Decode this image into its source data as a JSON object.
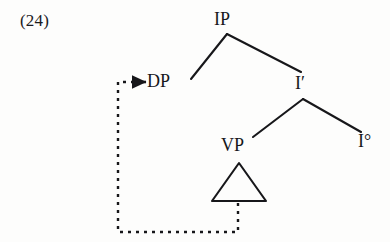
{
  "figure": {
    "example_number": "(24)",
    "background_color": "#fdfdfc",
    "ink_color": "#17171a",
    "caption_note": "syntax tree with DP movement from VP-internal position to specifier of IP"
  },
  "tree": {
    "nodes": [
      {
        "id": "ip",
        "label": "IP",
        "x": 227,
        "y": 20,
        "role": "root"
      },
      {
        "id": "dp",
        "label": "DP",
        "x": 167,
        "y": 84,
        "role": "specifier"
      },
      {
        "id": "ibar",
        "label": "I′",
        "x": 303,
        "y": 85,
        "role": "intermediate"
      },
      {
        "id": "vp",
        "label": "VP",
        "x": 236,
        "y": 148,
        "role": "complement"
      },
      {
        "id": "i0",
        "label": "I°",
        "x": 368,
        "y": 143,
        "role": "head"
      }
    ],
    "branches": [
      {
        "from": "ip",
        "to": "dp",
        "x1": 227,
        "y1": 34,
        "x2": 191,
        "y2": 79
      },
      {
        "from": "ip",
        "to": "ibar",
        "x1": 227,
        "y1": 34,
        "x2": 301,
        "y2": 72
      },
      {
        "from": "ibar",
        "to": "vp",
        "x1": 303,
        "y1": 99,
        "x2": 253,
        "y2": 137
      },
      {
        "from": "ibar",
        "to": "i0",
        "x1": 303,
        "y1": 99,
        "x2": 361,
        "y2": 132
      }
    ],
    "triangle": {
      "apex_x": 239,
      "apex_y": 163,
      "left_x": 212,
      "left_y": 201,
      "right_x": 266,
      "right_y": 201,
      "label": "VP-triangle"
    },
    "movement_arrow": {
      "label": "movement-path",
      "style": "dotted",
      "path": "M 238 203 L 238 232 L 118 232 L 118 82 L 132 82",
      "arrow_tip_x": 146,
      "arrow_tip_y": 82,
      "target_node": "dp"
    }
  }
}
